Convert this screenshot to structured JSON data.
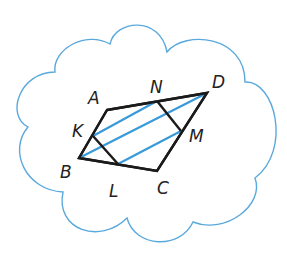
{
  "diagram": {
    "type": "parallelogram-in-cloud",
    "colors": {
      "cloud_outline": "#5aa9dc",
      "shape_outline": "#1a1a1a",
      "hatch_lines": "#3a9ad9",
      "labels": "#222222",
      "background": "#ffffff"
    },
    "vertices": {
      "A": {
        "label": "A",
        "x": 107,
        "y": 110,
        "lx": 88,
        "ly": 104
      },
      "B": {
        "label": "B",
        "x": 79,
        "y": 158,
        "lx": 60,
        "ly": 178
      },
      "C": {
        "label": "C",
        "x": 157,
        "y": 171,
        "lx": 157,
        "ly": 194
      },
      "D": {
        "label": "D",
        "x": 207,
        "y": 93,
        "lx": 212,
        "ly": 88
      },
      "K": {
        "label": "K",
        "x": 93,
        "y": 136,
        "lx": 72,
        "ly": 137
      },
      "L": {
        "label": "L",
        "x": 118,
        "y": 164,
        "lx": 109,
        "ly": 197
      },
      "M": {
        "label": "M",
        "x": 181,
        "y": 131,
        "lx": 189,
        "ly": 142
      },
      "N": {
        "label": "N",
        "x": 157,
        "y": 101,
        "lx": 150,
        "ly": 93
      }
    },
    "parallelogram": [
      "A",
      "D",
      "C",
      "B"
    ],
    "inner_segments": [
      [
        "K",
        "L"
      ],
      [
        "N",
        "M"
      ]
    ],
    "hatch_segments": [
      [
        "K",
        "N"
      ],
      [
        "B",
        "D"
      ],
      [
        "L",
        "M"
      ]
    ]
  }
}
